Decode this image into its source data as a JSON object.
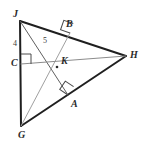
{
  "figure": {
    "kind": "geometry-diagram",
    "background_color": "#ffffff",
    "stroke_color_main": "#1f1f1f",
    "stroke_color_cevian": "#9a9a9a",
    "stroke_color_altitude": "#6e6e6e",
    "label_color": "#2a2a2a"
  },
  "vertices": [
    {
      "id": "J",
      "label": "J",
      "x": 20,
      "y": 21,
      "label_x": 13,
      "label_y": 9
    },
    {
      "id": "G",
      "label": "G",
      "x": 21,
      "y": 126,
      "label_x": 18,
      "label_y": 130
    },
    {
      "id": "H",
      "label": "H",
      "x": 126,
      "y": 56,
      "label_x": 130,
      "label_y": 50
    }
  ],
  "foot_points": [
    {
      "id": "B",
      "label": "B",
      "x": 70,
      "y": 33,
      "label_x": 66,
      "label_y": 19,
      "on_side": "JH"
    },
    {
      "id": "A",
      "label": "A",
      "x": 68,
      "y": 95,
      "label_x": 71,
      "label_y": 99,
      "on_side": "GH"
    },
    {
      "id": "C",
      "label": "C",
      "x": 21,
      "y": 64,
      "label_x": 11,
      "label_y": 58,
      "on_side": "JG"
    }
  ],
  "intersection": {
    "id": "K",
    "label": "K",
    "x": 57,
    "y": 67,
    "label_x": 61,
    "label_y": 56
  },
  "measures": [
    {
      "id": "JC",
      "label": "4",
      "x": 13,
      "y": 40,
      "segment": "J to C"
    },
    {
      "id": "JK",
      "label": "5",
      "x": 43,
      "y": 37,
      "segment": "J to K"
    }
  ],
  "right_angle_marks": [
    {
      "id": "right-angle-C",
      "at": "C",
      "x": 21,
      "y": 54,
      "size": 10,
      "rotation": 0
    },
    {
      "id": "right-angle-B",
      "at": "B",
      "x": 70,
      "y": 33,
      "size": 10,
      "rotation": -27
    },
    {
      "id": "right-angle-A",
      "at": "A",
      "x": 68,
      "y": 95,
      "size": 10,
      "rotation": 34
    }
  ],
  "segments": [
    {
      "id": "side-JH",
      "from": "J",
      "to": "H",
      "style": "main"
    },
    {
      "id": "side-JG",
      "from": "J",
      "to": "G",
      "style": "main"
    },
    {
      "id": "side-GH",
      "from": "G",
      "to": "H",
      "style": "main"
    },
    {
      "id": "altitude-JA",
      "from": "J",
      "to": "A",
      "style": "altitude"
    },
    {
      "id": "altitude-GB",
      "from": "G",
      "to": "B",
      "style": "cevian"
    },
    {
      "id": "altitude-HC",
      "from": "H",
      "to": "C",
      "style": "cevian"
    }
  ]
}
